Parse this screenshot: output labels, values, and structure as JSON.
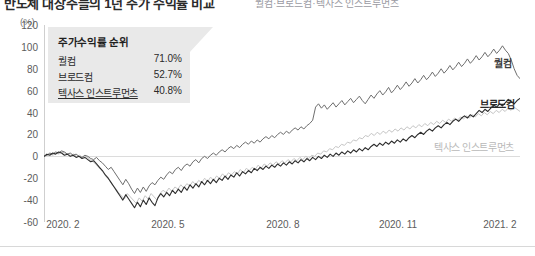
{
  "headline": {
    "title": "반도체 대장주들의 1년 주가 수익률 비교",
    "subtitle": "퀄컴·브로드컴·텍사스 인스트루먼츠"
  },
  "legend": {
    "title": "주가수익률 순위",
    "rows": [
      {
        "name": "퀄컴",
        "value": "71.0%"
      },
      {
        "name": "브로드컴",
        "value": "52.7%"
      },
      {
        "name": "텍사스 인스트루먼츠",
        "value": "40.8%"
      }
    ]
  },
  "series_labels": {
    "qualcomm": "퀄컴",
    "broadcom": "브로드컴",
    "texas_instruments": "텍사스 인스트루먼츠"
  },
  "axis": {
    "y_unit": "(%)",
    "y_ticks": [
      "120",
      "100",
      "80",
      "60",
      "40",
      "20",
      "0",
      "-20",
      "-40",
      "-60"
    ],
    "x_ticks": [
      "2020. 2",
      "2020. 5",
      "2020. 8",
      "2020. 11",
      "2021. 2"
    ]
  },
  "colors": {
    "qualcomm": "#6e6e6e",
    "broadcom": "#2d2d2d",
    "texas_instruments": "#c6c6c6",
    "legend_bg": "#e9e9e9",
    "axis": "#cfcfcf",
    "zero_line": "#dcdcdc"
  },
  "chart_data": {
    "type": "line",
    "title": "반도체 대장주들의 1년 주가 수익률 비교",
    "xlabel": "",
    "ylabel": "(%)",
    "ylim": [
      -60,
      120
    ],
    "xlim": [
      "2020.2",
      "2021.2"
    ],
    "grid": false,
    "legend_position": "inline-right",
    "y_ticks": [
      120,
      100,
      80,
      60,
      40,
      20,
      0,
      -20,
      -40,
      -60
    ],
    "x_tick_labels": [
      "2020. 2",
      "2020. 5",
      "2020. 8",
      "2020. 11",
      "2021. 2"
    ],
    "x_tick_positions": [
      0.04,
      0.26,
      0.49,
      0.74,
      0.97
    ],
    "annotations": [
      {
        "text": "주가수익률 순위",
        "type": "callout-title"
      },
      {
        "text": "퀄컴 71.0%",
        "type": "callout-row"
      },
      {
        "text": "브로드컴 52.7%",
        "type": "callout-row"
      },
      {
        "text": "텍사스 인스트루먼츠 40.8%",
        "type": "callout-row"
      }
    ],
    "series": [
      {
        "name": "퀄컴",
        "color": "#6e6e6e",
        "final_value": 71.0,
        "values": [
          0,
          1,
          3,
          2,
          4,
          3,
          5,
          4,
          2,
          3,
          1,
          2,
          0,
          -1,
          1,
          0,
          -2,
          -3,
          -1,
          -4,
          -6,
          -9,
          -12,
          -10,
          -14,
          -18,
          -22,
          -26,
          -21,
          -25,
          -30,
          -34,
          -29,
          -33,
          -28,
          -32,
          -27,
          -24,
          -26,
          -22,
          -19,
          -21,
          -17,
          -14,
          -16,
          -12,
          -10,
          -13,
          -9,
          -7,
          -9,
          -5,
          -3,
          -6,
          -2,
          0,
          -2,
          1,
          3,
          1,
          4,
          6,
          4,
          7,
          9,
          7,
          10,
          8,
          11,
          13,
          11,
          14,
          12,
          15,
          13,
          16,
          18,
          16,
          19,
          17,
          20,
          22,
          20,
          23,
          21,
          24,
          26,
          24,
          27,
          25,
          28,
          30,
          33,
          45,
          48,
          44,
          47,
          43,
          46,
          49,
          45,
          48,
          51,
          47,
          50,
          53,
          49,
          52,
          55,
          51,
          48,
          52,
          56,
          53,
          57,
          60,
          56,
          59,
          63,
          58,
          61,
          65,
          61,
          64,
          68,
          64,
          67,
          71,
          67,
          70,
          74,
          70,
          73,
          77,
          73,
          76,
          80,
          76,
          79,
          83,
          79,
          82,
          86,
          82,
          85,
          89,
          85,
          88,
          92,
          88,
          91,
          95,
          91,
          94,
          98,
          94,
          97,
          101,
          97,
          94,
          88,
          80,
          74,
          71
        ]
      },
      {
        "name": "브로드컴",
        "color": "#2d2d2d",
        "final_value": 52.7,
        "values": [
          0,
          2,
          1,
          3,
          2,
          4,
          3,
          1,
          2,
          0,
          1,
          -1,
          0,
          -2,
          -1,
          -3,
          -5,
          -4,
          -7,
          -10,
          -13,
          -17,
          -20,
          -24,
          -28,
          -32,
          -36,
          -40,
          -35,
          -39,
          -43,
          -47,
          -42,
          -46,
          -40,
          -44,
          -38,
          -42,
          -45,
          -38,
          -34,
          -37,
          -33,
          -36,
          -31,
          -34,
          -30,
          -33,
          -28,
          -31,
          -26,
          -29,
          -25,
          -28,
          -23,
          -26,
          -22,
          -25,
          -21,
          -24,
          -20,
          -22,
          -18,
          -21,
          -17,
          -19,
          -15,
          -18,
          -14,
          -16,
          -13,
          -15,
          -11,
          -13,
          -10,
          -12,
          -9,
          -11,
          -8,
          -10,
          -7,
          -9,
          -6,
          -8,
          -5,
          -7,
          -4,
          -6,
          -3,
          -5,
          -2,
          -4,
          -1,
          -3,
          0,
          -2,
          1,
          -1,
          2,
          0,
          3,
          1,
          4,
          2,
          5,
          3,
          6,
          4,
          7,
          5,
          8,
          6,
          9,
          11,
          9,
          12,
          10,
          13,
          11,
          14,
          12,
          15,
          13,
          16,
          14,
          17,
          19,
          17,
          20,
          22,
          20,
          23,
          25,
          23,
          26,
          28,
          26,
          29,
          31,
          29,
          32,
          34,
          32,
          35,
          37,
          35,
          38,
          36,
          39,
          42,
          40,
          43,
          41,
          44,
          47,
          45,
          48,
          46,
          49,
          52,
          50,
          48,
          51,
          53
        ]
      },
      {
        "name": "텍사스 인스트루먼츠",
        "color": "#c6c6c6",
        "final_value": 40.8,
        "values": [
          0,
          1,
          2,
          1,
          3,
          2,
          4,
          3,
          2,
          1,
          2,
          0,
          1,
          -1,
          0,
          -2,
          -4,
          -6,
          -9,
          -12,
          -15,
          -19,
          -22,
          -26,
          -29,
          -33,
          -36,
          -39,
          -34,
          -37,
          -40,
          -43,
          -38,
          -41,
          -36,
          -39,
          -34,
          -37,
          -40,
          -34,
          -31,
          -33,
          -29,
          -32,
          -28,
          -30,
          -26,
          -29,
          -25,
          -27,
          -23,
          -26,
          -22,
          -24,
          -20,
          -23,
          -19,
          -22,
          -18,
          -20,
          -16,
          -19,
          -15,
          -17,
          -14,
          -16,
          -12,
          -15,
          -11,
          -13,
          -10,
          -12,
          -8,
          -11,
          -7,
          -9,
          -6,
          -8,
          -5,
          -7,
          -4,
          -6,
          -3,
          -5,
          -2,
          -4,
          -1,
          -3,
          0,
          -2,
          1,
          0,
          3,
          2,
          5,
          4,
          7,
          6,
          9,
          8,
          11,
          10,
          13,
          12,
          15,
          14,
          17,
          16,
          19,
          18,
          21,
          19,
          22,
          20,
          23,
          21,
          24,
          22,
          25,
          23,
          26,
          24,
          27,
          25,
          28,
          26,
          29,
          27,
          30,
          28,
          31,
          29,
          32,
          30,
          33,
          31,
          34,
          32,
          35,
          33,
          36,
          34,
          37,
          35,
          38,
          36,
          39,
          37,
          40,
          38,
          41,
          39,
          42,
          40,
          43,
          41,
          44,
          42,
          45,
          43,
          41
        ]
      }
    ]
  }
}
